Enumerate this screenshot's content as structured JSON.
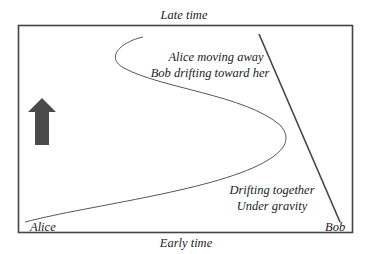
{
  "diagram": {
    "top_label": "Late time",
    "bottom_label": "Early time",
    "alice_label": "Alice",
    "bob_label": "Bob",
    "upper_annotation": [
      "Alice moving away",
      "Bob drifting toward her"
    ],
    "lower_annotation": [
      "Drifting together",
      "Under gravity"
    ],
    "arrow_icon": "up-arrow-icon",
    "colors": {
      "frame": "#444444",
      "alice_worldline": "#555555",
      "bob_worldline": "#444444",
      "arrow": "#4a4a4a",
      "text": "#222222"
    }
  }
}
